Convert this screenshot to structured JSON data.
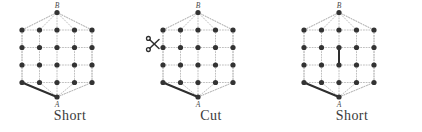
{
  "figure": {
    "background_color": "#ffffff",
    "dot_color": "#333333",
    "grid_color": "#b9b9b9",
    "bold_edge_color": "#2e2e2e",
    "label_color": "#4a4a4a",
    "caption_color": "#3a3a3a",
    "grid": {
      "columns": 5,
      "rows": 4,
      "spacing_x": 17.5,
      "spacing_y": 17.5,
      "origin_x": 22,
      "origin_y": 30,
      "dot_radius": 2.6
    },
    "apex_top": {
      "label": "B",
      "x": 57,
      "y": 12.5
    },
    "apex_bottom": {
      "label": "A",
      "x": 57,
      "y": 97
    }
  },
  "panels": [
    {
      "id": "panel-short-1",
      "caption": "Short",
      "left": 0,
      "has_scissors": false,
      "scissors_icon": "",
      "bold_edges": [
        {
          "name": "edge-bottomleft-to-A",
          "x1": 22,
          "y1": 82.5,
          "x2": 57,
          "y2": 97
        }
      ]
    },
    {
      "id": "panel-cut",
      "caption": "Cut",
      "left": 141,
      "has_scissors": true,
      "scissors_icon": "scissors-icon",
      "scissors": {
        "x": 13,
        "y": 44
      },
      "bold_edges": [
        {
          "name": "edge-bottomleft-to-A",
          "x1": 22,
          "y1": 82.5,
          "x2": 57,
          "y2": 97
        }
      ]
    },
    {
      "id": "panel-short-2",
      "caption": "Short",
      "left": 282,
      "has_scissors": false,
      "scissors_icon": "",
      "bold_edges": [
        {
          "name": "edge-bottomleft-to-A",
          "x1": 22,
          "y1": 82.5,
          "x2": 57,
          "y2": 97
        },
        {
          "name": "edge-center-vertical",
          "x1": 57,
          "y1": 47.5,
          "x2": 57,
          "y2": 65
        }
      ]
    }
  ]
}
